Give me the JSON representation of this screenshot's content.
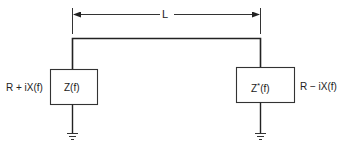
{
  "diagram": {
    "dimension_label": "L",
    "left_load": {
      "box_label": "Z(f)",
      "side_label": "R + iX(f)"
    },
    "right_load": {
      "box_label": "Z*(f)",
      "side_label": "R − iX(f)"
    },
    "colors": {
      "line": "#222222",
      "background": "#ffffff"
    }
  }
}
